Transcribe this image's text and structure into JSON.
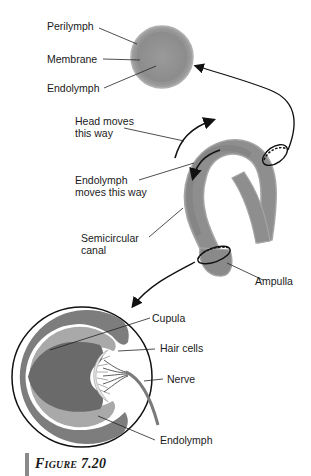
{
  "figure": {
    "caption": "Figure 7.20",
    "caption_prefix": "Figure",
    "caption_number": "7.20"
  },
  "labels": {
    "perilymph": "Perilymph",
    "membrane": "Membrane",
    "endolymph_top": "Endolymph",
    "head_moves": "Head moves\nthis way",
    "endolymph_moves": "Endolymph\nmoves this way",
    "semicircular_canal": "Semicircular\ncanal",
    "ampulla": "Ampulla",
    "cupula": "Cupula",
    "hair_cells": "Hair cells",
    "nerve": "Nerve",
    "endolymph_bottom": "Endolymph"
  },
  "colors": {
    "canal_outer": "#9a9a9a",
    "canal_inner": "#888888",
    "sphere": "#8f8f8f",
    "cupula_dark": "#6e6e6e",
    "cupula_light": "#a8a8a8",
    "ampulla_ring": "#7a7a7a",
    "line": "#111111",
    "caption_bar": "#8a8a8a"
  }
}
